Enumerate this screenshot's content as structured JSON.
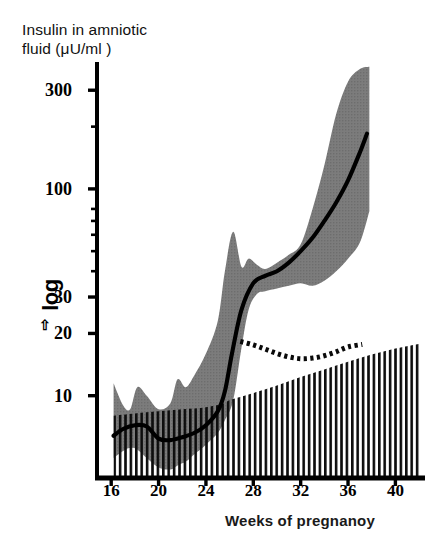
{
  "chart_data": {
    "type": "area",
    "title": "Insulin in amniotic\nfluid (μU/ml )",
    "xlabel": "Weeks of pregnanoy",
    "ylabel": "log",
    "ylabel_arrow": "⇧",
    "yscale": "log",
    "ylim": [
      4,
      420
    ],
    "xlim": [
      14.8,
      42.5
    ],
    "grid": false,
    "legend": "none",
    "xticks": [
      16,
      20,
      24,
      28,
      32,
      36,
      40
    ],
    "xtick_labels": [
      "16",
      "20",
      "24",
      "28",
      "32",
      "36",
      "40"
    ],
    "yticks": [
      10,
      20,
      30,
      100,
      300
    ],
    "ytick_labels": [
      "10",
      "20",
      "30",
      "100",
      "300"
    ],
    "yminor_ticks": [
      40,
      50,
      60,
      70,
      80,
      200
    ],
    "series": [
      {
        "name": "median insulin (diabetic pregnancies)",
        "style": "solid-line",
        "color": "#000000",
        "x": [
          16.2,
          17,
          18,
          19,
          20,
          21,
          22,
          23,
          24,
          25,
          25.6,
          26.2,
          27,
          28,
          29,
          30,
          31,
          32,
          33,
          34,
          35,
          36,
          37,
          37.6
        ],
        "values": [
          6.4,
          6.9,
          7.2,
          7.1,
          6.2,
          6.1,
          6.3,
          6.6,
          7.2,
          8.4,
          10.5,
          16,
          26,
          35,
          38,
          40,
          44,
          50,
          58,
          70,
          86,
          110,
          150,
          185
        ]
      },
      {
        "name": "reference range band (shaded)",
        "style": "shaded-band",
        "color": "#737373",
        "x": [
          16.2,
          17,
          17.6,
          18.2,
          19,
          20,
          21,
          21.6,
          22.3,
          23,
          24,
          25,
          25.6,
          26.3,
          27,
          27.6,
          28.3,
          29,
          30,
          31,
          32,
          33,
          34,
          35,
          36,
          37,
          37.8
        ],
        "upper": [
          11.5,
          9.0,
          8.6,
          11.0,
          10.0,
          8.6,
          9.2,
          12.0,
          11.0,
          12.5,
          16.0,
          23.0,
          40.0,
          62.0,
          42.0,
          46.0,
          43.0,
          41.0,
          44.0,
          48.0,
          54.0,
          80.0,
          130.0,
          230.0,
          330.0,
          380.0,
          390.0
        ],
        "lower": [
          5.0,
          5.4,
          5.6,
          5.5,
          5.0,
          4.5,
          4.4,
          4.6,
          4.8,
          5.2,
          5.8,
          6.6,
          7.6,
          9.5,
          17.0,
          26.0,
          31.0,
          32.0,
          33.0,
          34.0,
          35.0,
          34.0,
          36.0,
          40.0,
          46.0,
          55.0,
          78.0
        ]
      },
      {
        "name": "dotted reference curve",
        "style": "dotted-line",
        "color": "#000000",
        "x": [
          26.9,
          28,
          29,
          30,
          31,
          32,
          33,
          34,
          35,
          36,
          37.2
        ],
        "values": [
          18.3,
          17.6,
          16.8,
          16.0,
          15.4,
          15.1,
          15.2,
          15.6,
          16.3,
          17.2,
          17.7
        ]
      },
      {
        "name": "hatched reference area",
        "style": "hatched-area",
        "color": "#000000",
        "x": [
          16.2,
          18,
          20,
          22,
          24,
          25.6,
          26,
          28,
          30,
          32,
          34,
          36,
          38,
          40,
          42
        ],
        "upper": [
          8.0,
          8.2,
          8.4,
          8.6,
          8.8,
          9.2,
          9.5,
          10.3,
          11.2,
          12.3,
          13.4,
          14.6,
          15.8,
          16.9,
          17.8
        ],
        "lower": [
          4.0,
          4.0,
          4.0,
          4.0,
          4.0,
          4.0,
          4.0,
          4.0,
          4.0,
          4.0,
          4.0,
          4.0,
          4.0,
          4.0,
          4.0
        ]
      }
    ]
  }
}
